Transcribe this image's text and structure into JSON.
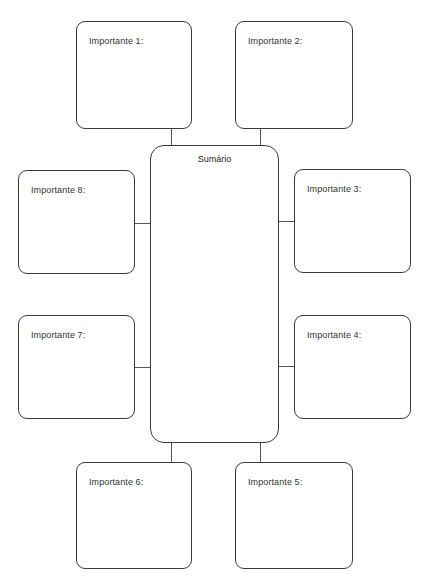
{
  "diagram": {
    "center": {
      "title": "Sumário"
    },
    "boxes": [
      {
        "id": 1,
        "label": "Importante 1:"
      },
      {
        "id": 2,
        "label": "Importante 2:"
      },
      {
        "id": 3,
        "label": "Importante 3:"
      },
      {
        "id": 4,
        "label": "Importante 4:"
      },
      {
        "id": 5,
        "label": "Importante 5:"
      },
      {
        "id": 6,
        "label": "Importante 6:"
      },
      {
        "id": 7,
        "label": "Importante 7:"
      },
      {
        "id": 8,
        "label": "Importante 8:"
      }
    ],
    "colors": {
      "border": "#3a3a3a",
      "connector": "#555555",
      "background": "#ffffff",
      "text": "#333333"
    }
  }
}
